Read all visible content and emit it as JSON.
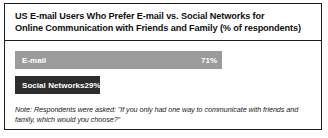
{
  "card": {
    "title_lines": [
      "US E-mail Users Who Prefer E-mail vs. Social Networks for",
      "Online Communication with Friends and Family (% of respondents)"
    ],
    "note_lines": [
      "Note: Respondents were asked: \"If you only had one way to communicate with friends and",
      "family, which would you choose?\""
    ]
  },
  "bars": [
    {
      "label": "E-mail",
      "value_label": "71%",
      "value": 71,
      "color": "#9b9b9b"
    },
    {
      "label": "Social Networks",
      "value_label": "29%",
      "value": 29,
      "color": "#2d2d2d"
    }
  ],
  "chart_data": {
    "type": "bar",
    "orientation": "horizontal",
    "title": "US E-mail Users Who Prefer E-mail vs. Social Networks for Online Communication with Friends and Family (% of respondents)",
    "categories": [
      "E-mail",
      "Social Networks"
    ],
    "values": [
      71,
      29
    ],
    "data_labels": [
      "71%",
      "29%"
    ],
    "series": [
      {
        "name": "% of respondents",
        "values": [
          71,
          29
        ]
      }
    ],
    "xlabel": "",
    "ylabel": "",
    "xlim": [
      0,
      100
    ],
    "unit": "percent",
    "grid": false,
    "legend": false,
    "colors": [
      "#9b9b9b",
      "#2d2d2d"
    ],
    "annotations": [
      "Note: Respondents were asked: \"If you only had one way to communicate with friends and family, which would you choose?\""
    ]
  }
}
